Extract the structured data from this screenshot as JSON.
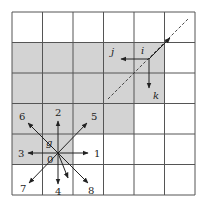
{
  "grid": {
    "rows": 6,
    "cols": 6,
    "x0": 12,
    "y0": 12,
    "cell": 30.5,
    "line_color": "#555555",
    "shade_color": "#d3d3d3",
    "shaded_cells": [
      [
        1,
        0
      ],
      [
        1,
        1
      ],
      [
        1,
        2
      ],
      [
        1,
        3
      ],
      [
        1,
        4
      ],
      [
        2,
        0
      ],
      [
        2,
        1
      ],
      [
        2,
        2
      ],
      [
        2,
        3
      ],
      [
        2,
        4
      ],
      [
        3,
        0
      ],
      [
        3,
        1
      ],
      [
        3,
        2
      ],
      [
        3,
        3
      ],
      [
        4,
        0
      ],
      [
        4,
        1
      ]
    ]
  },
  "origin_star": {
    "center": [
      58,
      153
    ],
    "center_label": "0",
    "point_label": "g",
    "directions": [
      {
        "label": "1",
        "to": [
          88,
          153
        ],
        "label_pos": [
          94,
          157
        ]
      },
      {
        "label": "2",
        "to": [
          58,
          121
        ],
        "label_pos": [
          55,
          116
        ]
      },
      {
        "label": "3",
        "to": [
          28,
          153
        ],
        "label_pos": [
          18,
          157
        ]
      },
      {
        "label": "4",
        "to": [
          58,
          184
        ],
        "label_pos": [
          55,
          195
        ]
      },
      {
        "label": "5",
        "to": [
          87,
          123
        ],
        "label_pos": [
          91,
          120
        ]
      },
      {
        "label": "6",
        "to": [
          28,
          123
        ],
        "label_pos": [
          19,
          120
        ]
      },
      {
        "label": "7",
        "to": [
          29,
          183
        ],
        "label_pos": [
          20,
          192
        ]
      },
      {
        "label": "8",
        "to": [
          88,
          183
        ],
        "label_pos": [
          88,
          194
        ]
      },
      {
        "label": "",
        "to": [
          68,
          178
        ],
        "label_pos": [
          0,
          0
        ]
      }
    ]
  },
  "local_frame": {
    "point": [
      149,
      59
    ],
    "labels": {
      "i": "i",
      "j": "j",
      "k": "k"
    },
    "j_arrow_to": [
      121,
      59
    ],
    "k_arrow_to": [
      149,
      88
    ],
    "ne_arrow_to": [
      170,
      38
    ],
    "dashed_line": {
      "from": [
        108,
        99
      ],
      "to": [
        189,
        18
      ]
    }
  }
}
